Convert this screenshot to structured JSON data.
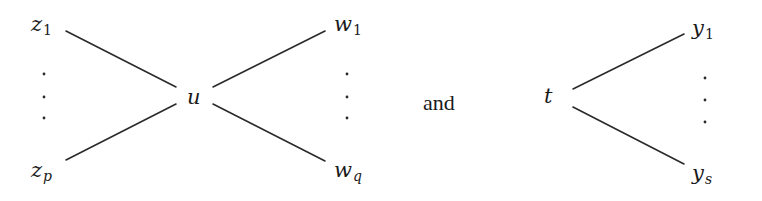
{
  "diagram": {
    "left_graph": {
      "center": {
        "name": "u",
        "x": 194,
        "y": 97
      },
      "left_nodes": [
        {
          "base": "z",
          "sub": "1",
          "x": 33,
          "y": 20
        },
        {
          "base": "z",
          "sub": "p",
          "x": 33,
          "y": 165
        }
      ],
      "right_nodes": [
        {
          "base": "w",
          "sub": "1",
          "x": 336,
          "y": 20
        },
        {
          "base": "w",
          "sub": "q",
          "x": 336,
          "y": 165
        }
      ],
      "edges": [
        {
          "from": "z_1",
          "to": "u",
          "x1": 66,
          "y1": 31,
          "x2": 176,
          "y2": 87
        },
        {
          "from": "z_p",
          "to": "u",
          "x1": 66,
          "y1": 160,
          "x2": 176,
          "y2": 104
        },
        {
          "from": "u",
          "to": "w_1",
          "x1": 213,
          "y1": 87,
          "x2": 325,
          "y2": 31
        },
        {
          "from": "u",
          "to": "w_q",
          "x1": 213,
          "y1": 104,
          "x2": 325,
          "y2": 161
        }
      ],
      "left_ellipsis": {
        "x": 44,
        "ys": [
          74,
          97,
          118
        ]
      },
      "right_ellipsis": {
        "x": 347,
        "ys": [
          74,
          97,
          118
        ]
      }
    },
    "connector_word": "and",
    "right_graph": {
      "center": {
        "name": "t",
        "x": 545,
        "y": 90
      },
      "right_nodes": [
        {
          "base": "y",
          "sub": "1",
          "x": 692,
          "y": 22
        },
        {
          "base": "y",
          "sub": "s",
          "x": 692,
          "y": 167
        }
      ],
      "edges": [
        {
          "from": "t",
          "to": "y_1",
          "x1": 573,
          "y1": 89,
          "x2": 684,
          "y2": 34
        },
        {
          "from": "t",
          "to": "y_s",
          "x1": 573,
          "y1": 107,
          "x2": 684,
          "y2": 164
        }
      ],
      "right_ellipsis": {
        "x": 705,
        "ys": [
          78,
          100,
          122
        ]
      }
    },
    "colors": {
      "stroke": "#2a2a2a",
      "text": "#1a1a1a",
      "background": "#ffffff"
    }
  }
}
